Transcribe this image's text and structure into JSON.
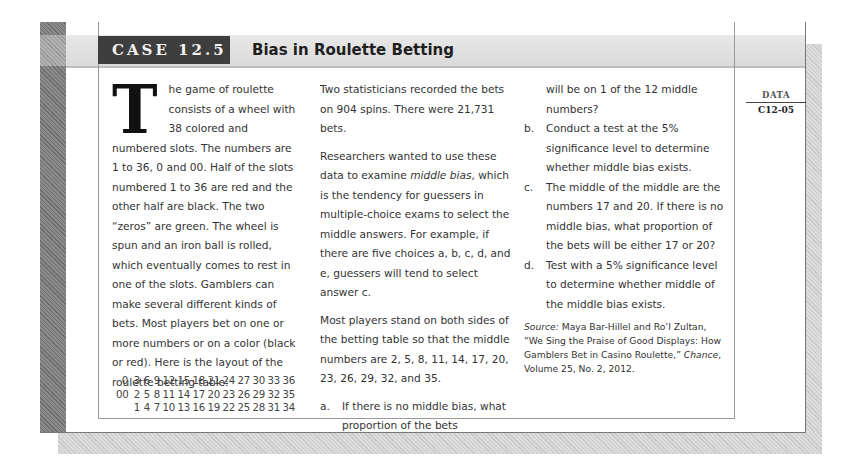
{
  "header": {
    "case_label": "CASE 12.5",
    "title": "Bias in Roulette Betting"
  },
  "sidebar": {
    "data_label": "DATA",
    "data_code": "C12-05"
  },
  "column1": {
    "dropcap": "T",
    "paragraph1": "he game of roulette consists of a wheel with 38 colored and numbered slots. The numbers are 1 to 36, 0 and 00. Half of the slots numbered 1 to 36 are red and the other half are black. The two “zeros” are green. The wheel is spun and an iron ball is rolled, which eventually comes to rest in one of the slots. Gamblers can make several different kinds of bets. Most players bet on one or more numbers or on a color (black or red). Here is the layout of the roulette betting table:"
  },
  "betting_table": {
    "rows": [
      [
        "0",
        "3",
        "6",
        "9",
        "12",
        "15",
        "18",
        "21",
        "24",
        "27",
        "30",
        "33",
        "36"
      ],
      [
        "00",
        "2",
        "5",
        "8",
        "11",
        "14",
        "17",
        "20",
        "23",
        "26",
        "29",
        "32",
        "35"
      ],
      [
        "",
        "1",
        "4",
        "7",
        "10",
        "13",
        "16",
        "19",
        "22",
        "25",
        "28",
        "31",
        "34"
      ]
    ]
  },
  "column2": {
    "paragraph1": "Two statisticians recorded the bets on 904 spins. There were 21,731 bets.",
    "paragraph2_before": "Researchers wanted to use these data to examine ",
    "paragraph2_italic": "middle bias",
    "paragraph2_after": ", which is the tendency for guessers in multiple-choice exams to select the middle answers. For example, if there are five choices a, b, c, d, and e, guessers will tend to select answer c.",
    "paragraph3": "Most players stand on both sides of the betting table so that the middle numbers are 2, 5, 8, 11, 14, 17, 20, 23, 26, 29, 32, and 35."
  },
  "questions": [
    {
      "label": "a.",
      "text": "If there is no middle bias, what proportion of the bets"
    },
    {
      "label": "",
      "text": "will be on 1 of the 12 middle numbers?"
    },
    {
      "label": "b.",
      "text": "Conduct a test at the 5% significance level to determine whether middle bias exists."
    },
    {
      "label": "c.",
      "text": "The middle of the middle are the numbers 17 and 20. If there is no middle bias, what proportion of the bets will be either 17 or 20?"
    },
    {
      "label": "d.",
      "text": "Test with a 5% significance level to determine whether middle of the middle bias exists."
    }
  ],
  "source": {
    "label": "Source:",
    "text": " Maya Bar-Hillel and Ro’I Zultan, “We Sing the Praise of Good Displays: How Gamblers Bet in Casino Roulette,” ",
    "journal": "Chance",
    "details": ", Volume 25, No. 2, 2012."
  }
}
